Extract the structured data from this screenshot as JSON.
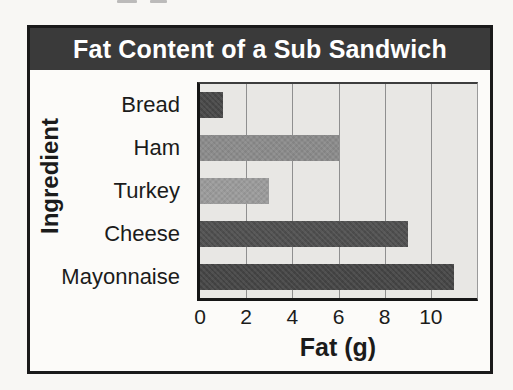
{
  "theme": {
    "page-bg": "#f8f7f4",
    "paper-bg": "#fcfbf9",
    "frame-border": "#1a1a1a",
    "banner-bg": "#3a3a3a",
    "banner-text": "#ffffff",
    "plot-bg": "#e8e7e4",
    "grid": "#8f8f8f",
    "axis": "#161616",
    "text": "#1b1b1b"
  },
  "chart_data": {
    "type": "bar",
    "orientation": "horizontal",
    "title": "Fat Content of a Sub Sandwich",
    "xlabel": "Fat (g)",
    "ylabel": "Ingredient",
    "categories": [
      "Bread",
      "Ham",
      "Turkey",
      "Cheese",
      "Mayonnaise"
    ],
    "values": [
      1,
      6,
      3,
      9,
      11
    ],
    "bar_colors": [
      "#474747",
      "#8b8b8b",
      "#9b9b9b",
      "#4f4f4f",
      "#454545"
    ],
    "xlim": [
      0,
      12
    ],
    "xticks": [
      0,
      2,
      4,
      6,
      8,
      10
    ],
    "gridlines": [
      2,
      4,
      6,
      8,
      10
    ],
    "grid_on": true,
    "legend": "none"
  }
}
